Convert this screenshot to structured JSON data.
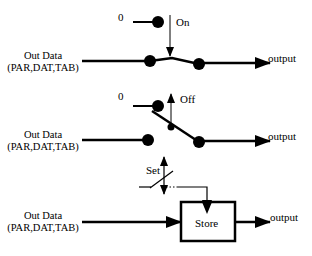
{
  "panels": [
    {
      "name": "switch-on",
      "input_label_line1": "Out Data",
      "input_label_line2": "(PAR,DAT,TAB)",
      "zero_label": "0",
      "state_label": "On",
      "output_label": "output"
    },
    {
      "name": "switch-off",
      "input_label_line1": "Out Data",
      "input_label_line2": "(PAR,DAT,TAB)",
      "zero_label": "0",
      "state_label": "Off",
      "output_label": "output"
    },
    {
      "name": "store",
      "input_label_line1": "Out Data",
      "input_label_line2": "(PAR,DAT,TAB)",
      "set_label": "Set",
      "box_label": "Store",
      "output_label": "output"
    }
  ],
  "colors": {
    "stroke": "#000000",
    "background": "#ffffff"
  }
}
